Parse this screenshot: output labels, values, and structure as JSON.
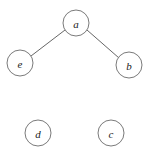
{
  "diagram": {
    "type": "graph",
    "title": "",
    "background_color": "#ffffff",
    "node_fill_color": "#ffffff",
    "node_stroke_color": "#6b6b6b",
    "edge_color": "#555555",
    "label_color": "#1a1a1a",
    "node_radius": 13,
    "nodes": [
      {
        "id": "a",
        "label": "a",
        "cx": 76,
        "cy": 23
      },
      {
        "id": "e",
        "label": "e",
        "cx": 20,
        "cy": 63
      },
      {
        "id": "b",
        "label": "b",
        "cx": 129,
        "cy": 65
      },
      {
        "id": "d",
        "label": "d",
        "cx": 38,
        "cy": 133
      },
      {
        "id": "c",
        "label": "c",
        "cx": 111,
        "cy": 133
      }
    ],
    "edges": [
      {
        "from": "a",
        "to": "e",
        "x1": 65,
        "y1": 30,
        "x2": 31,
        "y2": 56
      },
      {
        "from": "a",
        "to": "b",
        "x1": 87,
        "y1": 30,
        "x2": 119,
        "y2": 58
      }
    ]
  }
}
